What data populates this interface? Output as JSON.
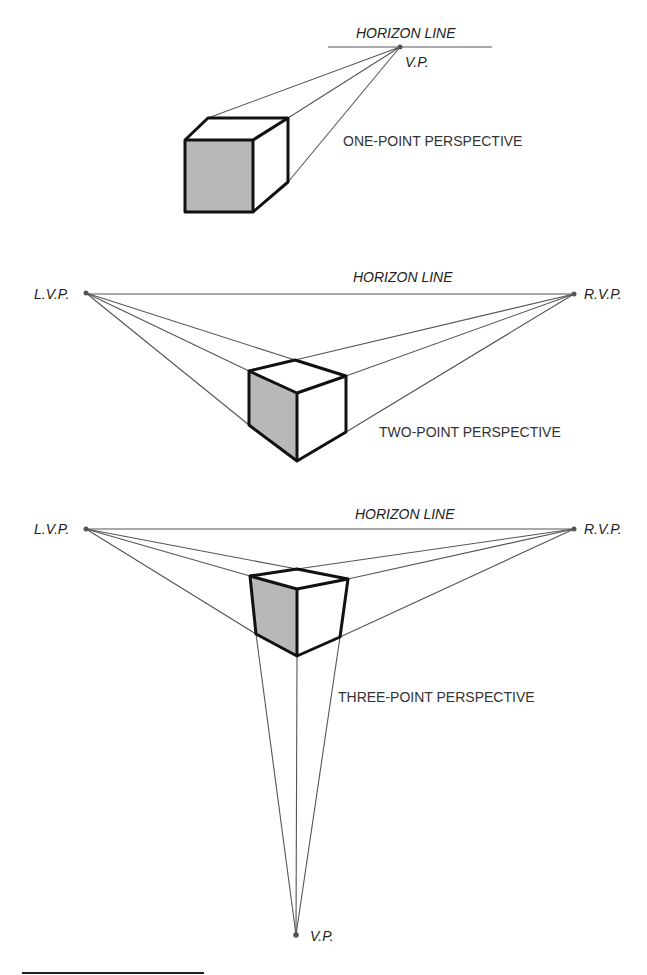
{
  "diagram": {
    "one_point": {
      "horizon_label": "HORIZON LINE",
      "vp_label": "V.P.",
      "caption": "ONE-POINT PERSPECTIVE"
    },
    "two_point": {
      "horizon_label": "HORIZON LINE",
      "lvp_label": "L.V.P.",
      "rvp_label": "R.V.P.",
      "caption": "TWO-POINT PERSPECTIVE"
    },
    "three_point": {
      "horizon_label": "HORIZON LINE",
      "lvp_label": "L.V.P.",
      "rvp_label": "R.V.P.",
      "vp_label": "V.P.",
      "caption": "THREE-POINT PERSPECTIVE"
    },
    "colors": {
      "shaded_face": "#b8b8b8",
      "edge": "#111111",
      "guide": "#555555"
    }
  }
}
